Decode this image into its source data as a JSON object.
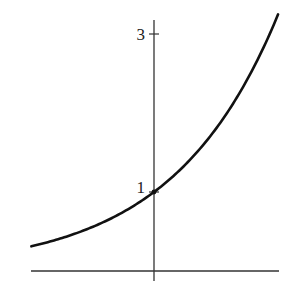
{
  "chart_data": {
    "type": "line",
    "title": "",
    "xlabel": "",
    "ylabel": "",
    "function": "y = 2^x",
    "xlim": [
      -1.7,
      1.7
    ],
    "ylim": [
      0,
      3.3
    ],
    "grid": false,
    "legend": null,
    "y_ticks": [
      {
        "value": 1,
        "label": "1"
      },
      {
        "value": 3,
        "label": "3"
      }
    ],
    "x_ticks": [],
    "annotations": [
      {
        "point": [
          0,
          1
        ],
        "note": "curve crosses y-axis at 1 (dot marker)"
      }
    ],
    "series": [
      {
        "name": "curve",
        "color": "#111111",
        "x": [
          -1.68,
          -1.5,
          -1.25,
          -1.0,
          -0.75,
          -0.5,
          -0.25,
          0,
          0.25,
          0.5,
          0.75,
          1.0,
          1.25,
          1.5,
          1.7
        ],
        "y": [
          0.31,
          0.35,
          0.42,
          0.5,
          0.59,
          0.71,
          0.84,
          1.0,
          1.19,
          1.41,
          1.68,
          2.0,
          2.38,
          2.83,
          3.25
        ]
      }
    ]
  },
  "axes": {
    "color": "#333333",
    "origin_px": [
      154,
      271
    ],
    "x_px_per_unit": 73,
    "y_px_per_unit": 79,
    "x_range_px": [
      31,
      279
    ],
    "y_range_px": [
      20,
      281
    ]
  }
}
